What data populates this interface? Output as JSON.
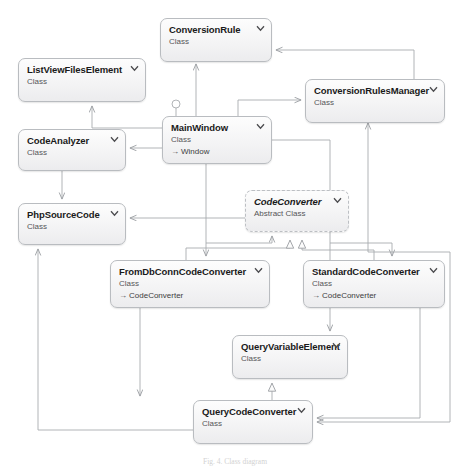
{
  "diagram": {
    "caption": "Fig. 4. Class diagram",
    "colors": {
      "box_border": "#b9bcc0",
      "box_fill": "#f4f4f5",
      "edge": "#a8abaf",
      "title_text": "#1a1a1a",
      "stereotype_text": "#555558"
    },
    "classes": [
      {
        "id": "conversion-rule",
        "name": "ConversionRule",
        "stereotype": "Class",
        "base": "",
        "abstract": false,
        "collapse_icon": "chevron-down-icon",
        "x": 160,
        "y": 18,
        "w": 112,
        "h": 44
      },
      {
        "id": "list-view-files-element",
        "name": "ListViewFilesElement",
        "stereotype": "Class",
        "base": "",
        "abstract": false,
        "collapse_icon": "chevron-down-icon",
        "x": 18,
        "y": 58,
        "w": 128,
        "h": 44
      },
      {
        "id": "conversion-rules-manager",
        "name": "ConversionRulesManager",
        "stereotype": "Class",
        "base": "",
        "abstract": false,
        "collapse_icon": "chevron-down-icon",
        "x": 305,
        "y": 79,
        "w": 140,
        "h": 44
      },
      {
        "id": "main-window",
        "name": "MainWindow",
        "stereotype": "Class",
        "base": "Window",
        "abstract": false,
        "collapse_icon": "chevron-down-icon",
        "x": 162,
        "y": 116,
        "w": 110,
        "h": 48
      },
      {
        "id": "code-analyzer",
        "name": "CodeAnalyzer",
        "stereotype": "Class",
        "base": "",
        "abstract": false,
        "collapse_icon": "chevron-down-icon",
        "x": 18,
        "y": 129,
        "w": 108,
        "h": 42
      },
      {
        "id": "php-source-code",
        "name": "PhpSourceCode",
        "stereotype": "Class",
        "base": "",
        "abstract": false,
        "collapse_icon": "chevron-down-icon",
        "x": 18,
        "y": 203,
        "w": 108,
        "h": 42
      },
      {
        "id": "code-converter",
        "name": "CodeConverter",
        "stereotype": "Abstract Class",
        "base": "",
        "abstract": true,
        "collapse_icon": "chevron-down-icon",
        "x": 245,
        "y": 190,
        "w": 104,
        "h": 42
      },
      {
        "id": "from-db-conn-code-converter",
        "name": "FromDbConnCodeConverter",
        "stereotype": "Class",
        "base": "CodeConverter",
        "abstract": false,
        "collapse_icon": "chevron-down-icon",
        "x": 110,
        "y": 260,
        "w": 160,
        "h": 48
      },
      {
        "id": "standard-code-converter",
        "name": "StandardCodeConverter",
        "stereotype": "Class",
        "base": "CodeConverter",
        "abstract": false,
        "collapse_icon": "chevron-down-icon",
        "x": 303,
        "y": 260,
        "w": 142,
        "h": 48
      },
      {
        "id": "query-variable-element",
        "name": "QueryVariableElement",
        "stereotype": "Class",
        "base": "",
        "abstract": false,
        "collapse_icon": "chevron-down-icon",
        "x": 232,
        "y": 335,
        "w": 116,
        "h": 44
      },
      {
        "id": "query-code-converter",
        "name": "QueryCodeConverter",
        "stereotype": "Class",
        "base": "",
        "abstract": false,
        "collapse_icon": "chevron-down-icon",
        "x": 193,
        "y": 400,
        "w": 120,
        "h": 44
      }
    ],
    "relationships": [
      {
        "from": "main-window",
        "to": "conversion-rule",
        "kind": "association"
      },
      {
        "from": "main-window",
        "to": "conversion-rules-manager",
        "kind": "association"
      },
      {
        "from": "main-window",
        "to": "list-view-files-element",
        "kind": "association"
      },
      {
        "from": "main-window",
        "to": "code-analyzer",
        "kind": "association"
      },
      {
        "from": "main-window",
        "to": "code-converter",
        "kind": "association"
      },
      {
        "from": "main-window",
        "to": "from-db-conn-code-converter",
        "kind": "association"
      },
      {
        "from": "main-window",
        "to": "query-variable-element",
        "kind": "association"
      },
      {
        "from": "main-window",
        "to": "standard-code-converter",
        "kind": "association"
      },
      {
        "from": "code-analyzer",
        "to": "php-source-code",
        "kind": "association"
      },
      {
        "from": "code-converter",
        "to": "php-source-code",
        "kind": "association"
      },
      {
        "from": "from-db-conn-code-converter",
        "to": "code-converter",
        "kind": "inheritance"
      },
      {
        "from": "standard-code-converter",
        "to": "code-converter",
        "kind": "inheritance"
      },
      {
        "from": "query-code-converter",
        "to": "query-variable-element",
        "kind": "inheritance"
      },
      {
        "from": "conversion-rules-manager",
        "to": "conversion-rule",
        "kind": "association"
      },
      {
        "from": "conversion-rules-manager",
        "to": "query-code-converter",
        "kind": "association"
      },
      {
        "from": "from-db-conn-code-converter",
        "to": "query-code-converter",
        "kind": "association"
      },
      {
        "from": "query-code-converter",
        "to": "php-source-code",
        "kind": "association"
      },
      {
        "from": "standard-code-converter",
        "to": "query-code-converter",
        "kind": "association"
      }
    ],
    "lollipop": {
      "on": "main-window",
      "label": ""
    }
  }
}
